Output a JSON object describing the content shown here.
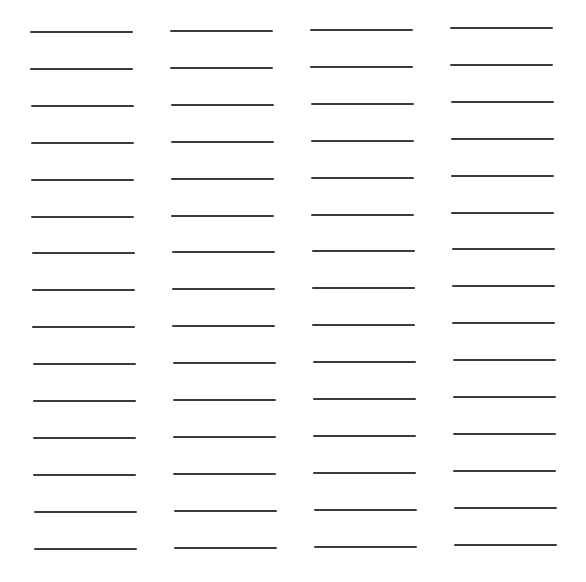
{
  "sheet": {
    "background": "#ffffff",
    "line_color": "#3a3a3a",
    "columns": 4,
    "rows": 15,
    "line_width": 103,
    "column_x_top": [
      30,
      170,
      310,
      450
    ],
    "column_x_bottom": [
      34,
      174,
      314,
      454
    ],
    "column_y_top": [
      31,
      30,
      29,
      27
    ],
    "row_spacing": 36.9
  }
}
